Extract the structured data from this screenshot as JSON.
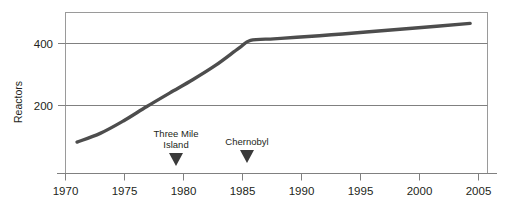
{
  "chart_data": {
    "type": "line",
    "title": "",
    "xlabel": "",
    "ylabel": "Reactors",
    "xlim": [
      1970,
      2006.5
    ],
    "ylim": [
      0,
      500
    ],
    "grid": "horizontal",
    "legend": "none",
    "x_ticks": [
      "1970",
      "1975",
      "1980",
      "1985",
      "1990",
      "1995",
      "2000",
      "2005"
    ],
    "x_tick_values": [
      1970,
      1975,
      1980,
      1985,
      1990,
      1995,
      2000,
      2005
    ],
    "y_ticks": [
      "200",
      "400"
    ],
    "y_tick_values": [
      200,
      400
    ],
    "series": [
      {
        "name": "Operating nuclear reactors worldwide",
        "x": [
          1971,
          1973,
          1975,
          1977,
          1979,
          1981,
          1983,
          1985,
          1986,
          1988,
          1990,
          1993,
          1996,
          2000,
          2005
        ],
        "values": [
          82,
          110,
          150,
          196,
          240,
          283,
          330,
          385,
          410,
          415,
          420,
          428,
          437,
          449,
          465
        ]
      }
    ],
    "annotations": [
      {
        "label_line1": "Three Mile",
        "label_line2": "Island",
        "x": 1980,
        "marker": "triangle-down"
      },
      {
        "label_line1": "Chernobyl",
        "label_line2": "",
        "x": 1986,
        "marker": "triangle-down"
      }
    ],
    "colors": {
      "line": "#4d4d4d",
      "grid": "#888888",
      "axis": "#808080",
      "text": "#231f20",
      "marker": "#3a3a3a",
      "background": "#ffffff"
    }
  }
}
